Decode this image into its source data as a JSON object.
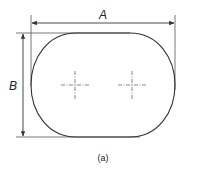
{
  "figure": {
    "caption": "(a)",
    "dimensions": {
      "width_label": "A",
      "height_label": "B"
    },
    "shape": "rounded-oblong (stadium-like) outline with two center marks",
    "center_marks": 2,
    "colors": {
      "line": "#333333",
      "background": "#ffffff"
    }
  }
}
